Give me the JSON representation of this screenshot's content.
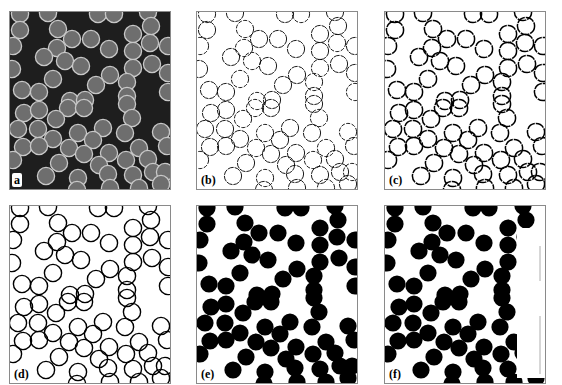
{
  "figure": {
    "panels": [
      {
        "id": "a",
        "label": "a",
        "style": "micrograph",
        "left": 9,
        "top": 11
      },
      {
        "id": "b",
        "label": "(b)",
        "style": "thin-edges",
        "left": 196,
        "top": 11
      },
      {
        "id": "c",
        "label": "(c)",
        "style": "thick-edges",
        "left": 384,
        "top": 11
      },
      {
        "id": "d",
        "label": "(d)",
        "style": "clean-edges",
        "left": 9,
        "top": 205
      },
      {
        "id": "e",
        "label": "(e)",
        "style": "filled",
        "left": 196,
        "top": 205
      },
      {
        "id": "f",
        "label": "(f)",
        "style": "filled-masked",
        "left": 384,
        "top": 205
      }
    ],
    "colors": {
      "background_dark": "#1e1e1e",
      "cell_fill": "#6e6e6e",
      "cell_rim": "#c8c8c8",
      "edge": "#000000",
      "frame": "#8a8a8a"
    },
    "cell_radius": 8.6,
    "cells": [
      [
        10,
        2
      ],
      [
        38,
        1
      ],
      [
        88,
        2
      ],
      [
        104,
        2
      ],
      [
        138,
        0
      ],
      [
        10,
        18
      ],
      [
        48,
        17
      ],
      [
        123,
        22
      ],
      [
        141,
        14
      ],
      [
        3,
        34
      ],
      [
        62,
        27
      ],
      [
        81,
        27
      ],
      [
        47,
        36
      ],
      [
        99,
        37
      ],
      [
        123,
        39
      ],
      [
        140,
        31
      ],
      [
        158,
        34
      ],
      [
        34,
        45
      ],
      [
        55,
        49
      ],
      [
        71,
        54
      ],
      [
        2,
        57
      ],
      [
        123,
        56
      ],
      [
        142,
        52
      ],
      [
        158,
        61
      ],
      [
        43,
        67
      ],
      [
        100,
        63
      ],
      [
        86,
        73
      ],
      [
        117,
        70
      ],
      [
        12,
        78
      ],
      [
        29,
        80
      ],
      [
        60,
        89
      ],
      [
        75,
        88
      ],
      [
        117,
        84
      ],
      [
        158,
        80
      ],
      [
        14,
        101
      ],
      [
        29,
        98
      ],
      [
        58,
        96
      ],
      [
        74,
        96
      ],
      [
        117,
        92
      ],
      [
        122,
        106
      ],
      [
        8,
        117
      ],
      [
        28,
        117
      ],
      [
        46,
        107
      ],
      [
        93,
        116
      ],
      [
        43,
        127
      ],
      [
        68,
        121
      ],
      [
        83,
        128
      ],
      [
        115,
        121
      ],
      [
        151,
        120
      ],
      [
        13,
        135
      ],
      [
        29,
        134
      ],
      [
        59,
        136
      ],
      [
        74,
        142
      ],
      [
        99,
        141
      ],
      [
        129,
        136
      ],
      [
        157,
        134
      ],
      [
        89,
        153
      ],
      [
        116,
        148
      ],
      [
        138,
        147
      ],
      [
        49,
        151
      ],
      [
        3,
        148
      ],
      [
        143,
        160
      ],
      [
        36,
        164
      ],
      [
        68,
        166
      ],
      [
        98,
        162
      ],
      [
        123,
        163
      ],
      [
        155,
        160
      ],
      [
        67,
        178
      ],
      [
        100,
        176
      ],
      [
        129,
        176
      ],
      [
        151,
        172
      ]
    ],
    "mask_f": {
      "x": 132,
      "y": 22,
      "width": 28,
      "height": 150
    }
  }
}
